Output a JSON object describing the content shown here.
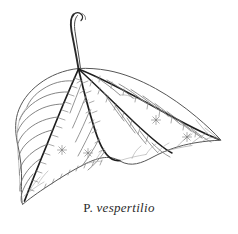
{
  "figure": {
    "kind": "botanical-line-drawing",
    "caption": {
      "genus_abbrev": "P.",
      "species": "vespertilio",
      "full": "P. vespertilio"
    },
    "colors": {
      "background": "#ffffff",
      "outline": "#555555",
      "primary_vein": "#1d1d1d",
      "secondary_vein": "#6a6a6a",
      "tertiary_vein": "#8e8e8e",
      "hair_mark": "#777777",
      "star_mark": "#8a8a8a",
      "caption": "#2b2b2b"
    },
    "parts": [
      {
        "name": "petiole",
        "label": "petiole"
      },
      {
        "name": "leaf-blade",
        "label": "leaf blade"
      },
      {
        "name": "midrib",
        "label": "midrib"
      },
      {
        "name": "primary-veins",
        "label": "primary veins",
        "count": 4
      },
      {
        "name": "secondary-veins",
        "label": "secondary veins"
      },
      {
        "name": "star-markings",
        "label": "stellate markings",
        "count": 4
      }
    ],
    "geometry": {
      "base_junction": [
        78,
        68
      ],
      "petiole_tip": [
        74,
        13
      ],
      "left_tip": [
        22,
        204
      ],
      "right_tip": [
        221,
        140
      ],
      "bottom_notch": [
        122,
        161
      ]
    }
  }
}
